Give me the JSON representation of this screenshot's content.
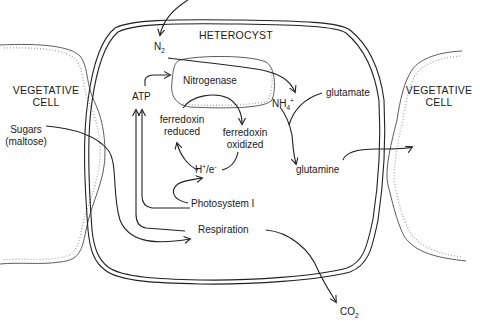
{
  "diagram": {
    "type": "biological pathway",
    "title": "HETEROCYST",
    "regions": {
      "left_cell": {
        "line1": "VEGETATIVE",
        "line2": "CELL"
      },
      "right_cell": {
        "line1": "VEGETATIVE",
        "line2": "CELL"
      },
      "heterocyst": "HETEROCYST"
    },
    "nodes": {
      "n2": {
        "base": "N",
        "sub": "2"
      },
      "nitrogenase": "Nitrogenase",
      "atp": "ATP",
      "nh4": {
        "base": "NH",
        "sub": "4",
        "sup": "+"
      },
      "glutamate": "glutamate",
      "glutamine": "glutamine",
      "ferredoxin_reduced": {
        "line1": "ferredoxin",
        "line2": "reduced"
      },
      "ferredoxin_oxidized": {
        "line1": "ferredoxin",
        "line2": "oxidized"
      },
      "h_e": {
        "h": "H",
        "hsup": "+",
        "sep": "/e",
        "esup": "-"
      },
      "photosystem": "Photosystem I",
      "respiration": "Respiration",
      "sugars": {
        "line1": "Sugars",
        "line2": "(maltose)"
      },
      "co2": {
        "base": "CO",
        "sub": "2"
      }
    },
    "edges": [
      {
        "from": "outside",
        "to": "N2"
      },
      {
        "from": "N2",
        "to": "NH4+",
        "via": "Nitrogenase"
      },
      {
        "from": "ATP",
        "to": "Nitrogenase"
      },
      {
        "from": "ferredoxin reduced",
        "to": "ferredoxin oxidized"
      },
      {
        "from": "ferredoxin oxidized",
        "to": "H+/e-"
      },
      {
        "from": "H+/e-",
        "to": "ferredoxin reduced"
      },
      {
        "from": "Photosystem I",
        "to": "H+/e-"
      },
      {
        "from": "Photosystem I",
        "to": "ATP"
      },
      {
        "from": "Respiration",
        "to": "ATP"
      },
      {
        "from": "Sugars (maltose)",
        "to": "Respiration"
      },
      {
        "from": "Respiration",
        "to": "CO2"
      },
      {
        "from": "NH4+",
        "to": "glutamine",
        "with": "glutamate"
      },
      {
        "from": "glutamine",
        "to": "right vegetative cell"
      }
    ]
  }
}
